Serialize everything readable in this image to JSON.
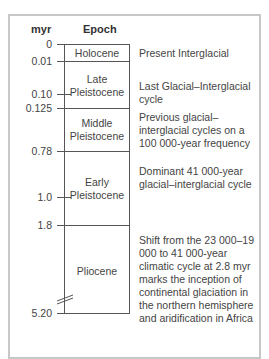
{
  "header": {
    "myr": "myr",
    "epoch": "Epoch"
  },
  "ticks": [
    {
      "label": "0"
    },
    {
      "label": "0.01"
    },
    {
      "label": "0.10"
    },
    {
      "label": "0.125"
    },
    {
      "label": "0.78"
    },
    {
      "label": "1.0"
    },
    {
      "label": "1.8"
    },
    {
      "label": "5.20"
    }
  ],
  "epochs": [
    {
      "name": "Holocene",
      "description": "Present Interglacial"
    },
    {
      "name": "Late\nPleistocene",
      "description": "Last Glacial–Interglacial cycle"
    },
    {
      "name": "Middle\nPleistocene",
      "description": "Previous glacial–interglacial cycles on a 100 000-year frequency"
    },
    {
      "name": "Early\nPleistocene",
      "description": "Dominant 41 000-year glacial–interglacial cycle"
    },
    {
      "name": "Pliocene",
      "description": "Shift from the 23 000–19 000 to 41 000-year climatic cycle at 2.8 myr marks the inception of continental glaciation in the northern hemisphere and aridification in Africa"
    }
  ],
  "colors": {
    "frame": "#c8c8c8",
    "line": "#555555",
    "text": "#444444"
  }
}
